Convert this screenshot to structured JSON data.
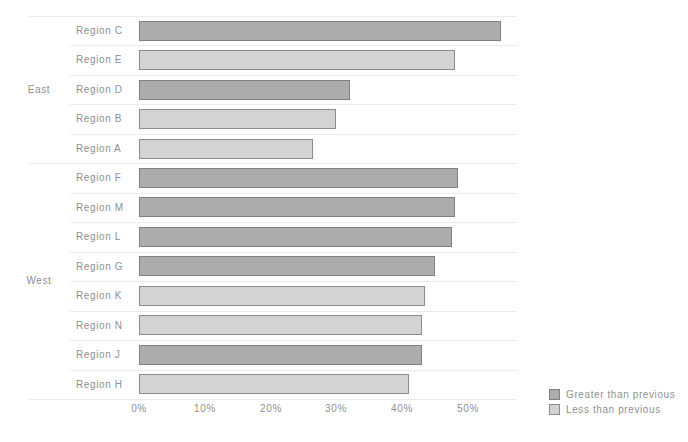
{
  "chart_data": {
    "type": "bar",
    "orientation": "horizontal",
    "title": "",
    "xlabel": "",
    "ylabel": "",
    "value_unit": "%",
    "xlim": [
      0,
      58
    ],
    "grid": "row-separators",
    "x_tick_labels": [
      "0%",
      "10%",
      "20%",
      "30%",
      "40%",
      "50%"
    ],
    "x_tick_values": [
      0,
      10,
      20,
      30,
      40,
      50
    ],
    "series": [
      {
        "name": "Greater than previous",
        "color": "#acacac"
      },
      {
        "name": "Less than previous",
        "color": "#d3d3d3"
      }
    ],
    "groups": [
      {
        "name": "East",
        "rows": [
          {
            "label": "Region C",
            "value": 55,
            "series": "Greater than previous"
          },
          {
            "label": "Region E",
            "value": 48,
            "series": "Less than previous"
          },
          {
            "label": "Region D",
            "value": 32,
            "series": "Greater than previous"
          },
          {
            "label": "Region B",
            "value": 30,
            "series": "Less than previous"
          },
          {
            "label": "Region A",
            "value": 26.5,
            "series": "Less than previous"
          }
        ]
      },
      {
        "name": "West",
        "rows": [
          {
            "label": "Region F",
            "value": 48.5,
            "series": "Greater than previous"
          },
          {
            "label": "Region M",
            "value": 48,
            "series": "Greater than previous"
          },
          {
            "label": "Region L",
            "value": 47.5,
            "series": "Greater than previous"
          },
          {
            "label": "Region G",
            "value": 45,
            "series": "Greater than previous"
          },
          {
            "label": "Region K",
            "value": 43.5,
            "series": "Less than previous"
          },
          {
            "label": "Region N",
            "value": 43,
            "series": "Less than previous"
          },
          {
            "label": "Region J",
            "value": 43,
            "series": "Greater than previous"
          },
          {
            "label": "Region H",
            "value": 41,
            "series": "Less than previous"
          }
        ]
      }
    ]
  },
  "legend": {
    "position": "bottom-right",
    "items": [
      {
        "label": "Greater than previous",
        "color": "#acacac"
      },
      {
        "label": "Less than previous",
        "color": "#d3d3d3"
      }
    ]
  },
  "colors": {
    "background": "#ffffff",
    "text": "#8f8f8f",
    "gridline": "#ececec",
    "bar_dark_fill": "#acacac",
    "bar_dark_border": "#7f7f7f",
    "bar_light_fill": "#d3d3d3",
    "bar_light_border": "#8c8c8c"
  }
}
